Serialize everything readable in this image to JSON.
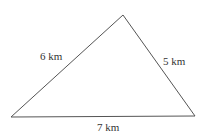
{
  "diagram": {
    "type": "triangle",
    "vertices": {
      "left": [
        11,
        117
      ],
      "top": [
        123,
        15
      ],
      "right": [
        195,
        116
      ]
    },
    "line_color": "#555555",
    "sides": [
      {
        "id": "left-side",
        "label": "6 km"
      },
      {
        "id": "right-side",
        "label": "5 km"
      },
      {
        "id": "bottom-side",
        "label": "7 km"
      }
    ]
  }
}
